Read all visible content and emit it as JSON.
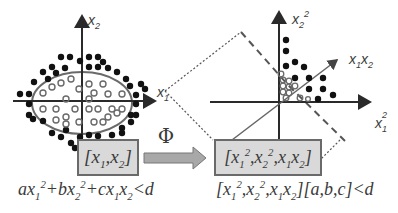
{
  "diagram": {
    "colors": {
      "axis": "#2a2a2a",
      "box_fill": "#d9d9d9",
      "box_border": "#6a6a6a",
      "dot_fill": "#111111",
      "circle_stroke": "#6a6a6a",
      "ellipse_stroke": "#6a6a6a",
      "arrow_fill": "#a8a8a8",
      "text": "#3a3a3a"
    },
    "left_plot": {
      "x_axis_label": "x1",
      "y_axis_label": "x2",
      "boundary": "ellipse",
      "input_vector_label": "[x1,x2]",
      "decision_formula": "ax1^2+bx2^2+cx1x2<d"
    },
    "mapping": {
      "symbol": "Φ",
      "arrow_icon": "right-arrow"
    },
    "right_plot": {
      "x_axis_label": "x1^2",
      "y_axis_label": "x2^2",
      "z_axis_label": "x1x2",
      "boundary": "plane",
      "feature_vector_label": "[x1^2,x2^2,x1x2]",
      "decision_formula": "[x1^2,x2^2,x1x2][a,b,c]<d"
    }
  }
}
